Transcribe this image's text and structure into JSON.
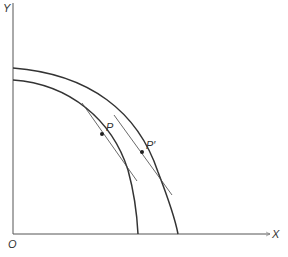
{
  "diagram": {
    "type": "production-possibility-frontiers",
    "axes": {
      "y_label": "Y",
      "x_label": "X",
      "origin_label": "O"
    },
    "curves": [
      {
        "name": "inner-frontier",
        "point_label": "P"
      },
      {
        "name": "outer-frontier",
        "point_label": "P′"
      }
    ],
    "colors": {
      "line": "#333333",
      "tangent": "#444444",
      "background": "#ffffff"
    }
  }
}
